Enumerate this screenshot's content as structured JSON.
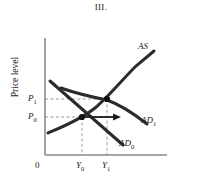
{
  "figure": {
    "title": "III.",
    "axis": {
      "y_label": "Price level",
      "origin_label": "0"
    },
    "ticks": {
      "y": [
        {
          "id": "P1",
          "base": "P",
          "sub": "1",
          "value_y": 99
        },
        {
          "id": "P0",
          "base": "P",
          "sub": "0",
          "value_y": 117
        }
      ],
      "x": [
        {
          "id": "Y0",
          "base": "Y",
          "sub": "0",
          "value_x": 82
        },
        {
          "id": "Y1",
          "base": "Y",
          "sub": "1",
          "value_x": 108
        }
      ]
    },
    "curves": [
      {
        "id": "AS",
        "base": "AS",
        "sub": "",
        "label_x": 138,
        "label_y": 42
      },
      {
        "id": "AD1",
        "base": "AD",
        "sub": "1",
        "label_x": 141,
        "label_y": 116
      },
      {
        "id": "AD0",
        "base": "AD",
        "sub": "0",
        "label_x": 119,
        "label_y": 139
      }
    ],
    "equilibria": [
      {
        "id": "E0",
        "x": 82,
        "y": 117,
        "price": "P0",
        "output": "Y0"
      },
      {
        "id": "E1",
        "x": 107,
        "y": 99,
        "price": "P1",
        "output": "Y1"
      }
    ],
    "shift_arrow": {
      "from_x": 84,
      "to_x": 120,
      "y": 117,
      "direction": "right"
    },
    "colors": {
      "curve": "#2b2b2b",
      "axis": "#808080",
      "dashed": "#8c8c8c",
      "text": "#1a1a1a",
      "background": "#ffffff"
    }
  }
}
